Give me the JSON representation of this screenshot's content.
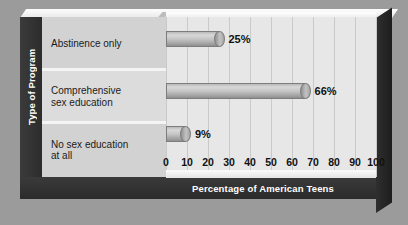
{
  "chart_data": {
    "type": "bar",
    "orientation": "horizontal",
    "title": "",
    "xlabel": "Percentage of American Teens",
    "ylabel": "Type of Program",
    "categories": [
      "Abstinence only",
      "Comprehensive sex education",
      "No sex education at all"
    ],
    "values": [
      25,
      66,
      9
    ],
    "value_labels": [
      "25%",
      "66%",
      "9%"
    ],
    "xlim": [
      0,
      100
    ],
    "xticks": [
      0,
      10,
      20,
      30,
      40,
      50,
      60,
      70,
      80,
      90,
      100
    ],
    "xtick_labels": [
      "0",
      "10",
      "20",
      "30",
      "40",
      "50",
      "60",
      "70",
      "80",
      "90",
      "100"
    ],
    "grid": "vertical",
    "legend": "none",
    "style": "3d-cylinder",
    "colors": {
      "background": "#9b9b9b",
      "frame": "#333333",
      "plot_area": "#e7e7e7",
      "label_panel": "#d2d2d2",
      "bar": "#b4b4b4",
      "gridline": "#c9c9c9",
      "axis_title_text": "#ffffff",
      "tick_text": "#111111"
    }
  },
  "categories": [
    {
      "line1": "Abstinence only",
      "line2": ""
    },
    {
      "line1": "Comprehensive",
      "line2": "sex education"
    },
    {
      "line1": "No sex education",
      "line2": "at all"
    }
  ]
}
